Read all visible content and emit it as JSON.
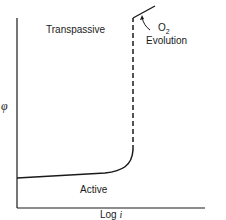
{
  "diagram": {
    "type": "polarization-curve",
    "y_axis_label": "φ",
    "x_axis_label": "Log i",
    "x_axis_label_prefix": "Log ",
    "x_axis_label_var": "i",
    "regions": {
      "transpassive": "Transpassive",
      "active": "Active"
    },
    "annotation": {
      "o2_main": "O",
      "o2_sub": "2",
      "evolution": "Evolution"
    },
    "line_color": "#1a1a1a"
  }
}
